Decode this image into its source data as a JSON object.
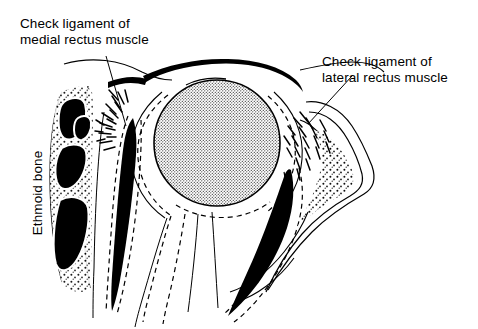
{
  "figure": {
    "background_color": "#ffffff",
    "ink_color": "#000000",
    "globe_fill": "stipple-gray",
    "style": "black-and-white anatomical line drawing with stipple shading"
  },
  "labels": {
    "medial_check_ligament": {
      "line1": "Check ligament of",
      "line2": "medial rectus muscle",
      "text": "Check ligament of\nmedial rectus muscle"
    },
    "lateral_check_ligament": {
      "line1": "Check ligament of",
      "line2": "lateral rectus muscle",
      "text": "Check ligament of\nlateral rectus muscle"
    },
    "ethmoid_bone": {
      "text": "Ethmoid bone",
      "orientation": "rotated-90-ccw"
    }
  },
  "structures": {
    "globe": "eyeball (stippled sphere)",
    "medial_rectus": "medial rectus muscle (solid black band)",
    "lateral_rectus": "lateral rectus muscle (solid black band)",
    "superior_band": "thick black band over globe",
    "ethmoid_air_cells": "ethmoid air cells (solid black cavities)",
    "orbital_fascia": "dashed fascial outlines",
    "check_ligament_fans": "radiating dash fans medial and lateral"
  },
  "leaders": {
    "medial_leader": "line from medial label down to medial check ligament fan",
    "lateral_leader": "line from lateral label down-left to lateral check ligament fan"
  }
}
